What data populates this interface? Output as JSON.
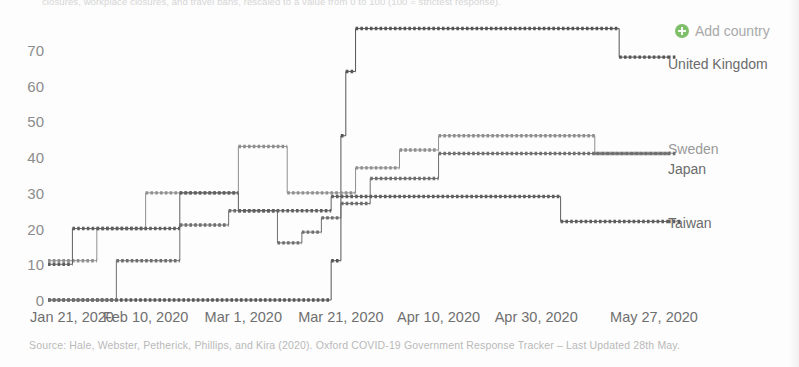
{
  "subtitle": "closures, workplace closures, and travel bans, rescaled to a value from 0 to 100 (100 = strictest response).",
  "add_country": {
    "label": "Add country",
    "icon": "plus-circle-icon",
    "color": "#7fbf6a"
  },
  "source": "Source: Hale, Webster, Petherick, Phillips, and Kira (2020). Oxford COVID-19 Government Response Tracker – Last Updated 28th May.",
  "legend": [
    {
      "label": "United Kingdom",
      "color": "#555555",
      "y_value": 68
    },
    {
      "label": "Sweden",
      "color": "#8f8f8f",
      "y_value": 46
    },
    {
      "label": "Japan",
      "color": "#6e6e6e",
      "y_value": 41
    },
    {
      "label": "Taiwan",
      "color": "#5f5f5f",
      "y_value": 22
    }
  ],
  "chart_data": {
    "type": "line",
    "title": "",
    "subtitle": "closures, workplace closures, and travel bans, rescaled to a value from 0 to 100 (100 = strictest response).",
    "xlabel": "",
    "ylabel": "",
    "grid": false,
    "legend_position": "right",
    "line_style": "step-post, dotted markers",
    "xlim": [
      "2020-01-21",
      "2020-05-27"
    ],
    "ylim": [
      0,
      76
    ],
    "yticks": [
      0,
      10,
      20,
      30,
      40,
      50,
      60,
      70
    ],
    "xticks": [
      "Jan 21, 2020",
      "Feb 10, 2020",
      "Mar 1, 2020",
      "Mar 21, 2020",
      "Apr 10, 2020",
      "Apr 30, 2020",
      "May 27, 2020"
    ],
    "xtick_days": [
      0,
      20,
      40,
      60,
      80,
      100,
      127
    ],
    "series": [
      {
        "name": "United Kingdom",
        "color": "#555555",
        "steps": [
          {
            "day": 0,
            "value": 0
          },
          {
            "day": 58,
            "value": 11
          },
          {
            "day": 60,
            "value": 46
          },
          {
            "day": 61,
            "value": 64
          },
          {
            "day": 63,
            "value": 76
          },
          {
            "day": 117,
            "value": 68
          }
        ]
      },
      {
        "name": "Sweden",
        "color": "#8f8f8f",
        "steps": [
          {
            "day": 0,
            "value": 11
          },
          {
            "day": 10,
            "value": 20
          },
          {
            "day": 20,
            "value": 30
          },
          {
            "day": 39,
            "value": 43
          },
          {
            "day": 49,
            "value": 30
          },
          {
            "day": 63,
            "value": 37
          },
          {
            "day": 72,
            "value": 42
          },
          {
            "day": 80,
            "value": 46
          },
          {
            "day": 112,
            "value": 41
          }
        ]
      },
      {
        "name": "Japan",
        "color": "#6e6e6e",
        "steps": [
          {
            "day": 0,
            "value": 0
          },
          {
            "day": 14,
            "value": 11
          },
          {
            "day": 27,
            "value": 21
          },
          {
            "day": 37,
            "value": 25
          },
          {
            "day": 47,
            "value": 16
          },
          {
            "day": 52,
            "value": 19
          },
          {
            "day": 56,
            "value": 23
          },
          {
            "day": 60,
            "value": 27
          },
          {
            "day": 66,
            "value": 34
          },
          {
            "day": 80,
            "value": 41
          }
        ]
      },
      {
        "name": "Taiwan",
        "color": "#5f5f5f",
        "steps": [
          {
            "day": 0,
            "value": 10
          },
          {
            "day": 5,
            "value": 20
          },
          {
            "day": 27,
            "value": 30
          },
          {
            "day": 39,
            "value": 25
          },
          {
            "day": 58,
            "value": 29
          },
          {
            "day": 105,
            "value": 22
          }
        ]
      }
    ]
  }
}
